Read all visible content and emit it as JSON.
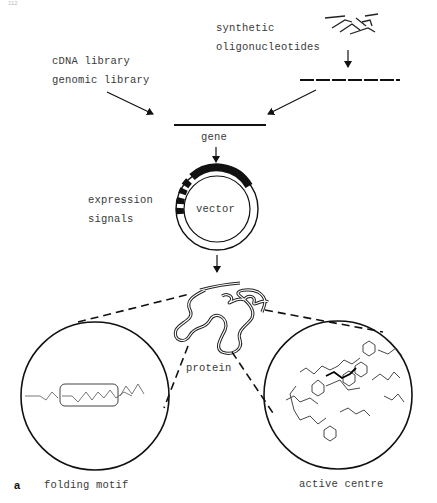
{
  "figure": {
    "page_number": "112",
    "panel_label": "a",
    "labels": {
      "cdna_library": "cDNA library",
      "genomic_library": "genomic library",
      "synthetic": "synthetic",
      "oligonucleotides": "oligonucleotides",
      "gene": "gene",
      "expression": "expression",
      "signals": "signals",
      "vector": "vector",
      "protein": "protein",
      "folding_motif": "folding motif",
      "active_centre": "active centre"
    }
  }
}
